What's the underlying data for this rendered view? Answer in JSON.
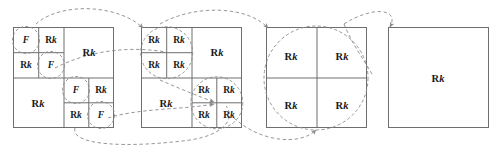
{
  "figure": {
    "background_color": "#ffffff",
    "line_color": "#6e6e6e",
    "dash_color": "#8a8a8a",
    "text_color": "#1a1a1a",
    "label_F": "F",
    "label_R": "R",
    "label_k": "k",
    "labels": {
      "fine_cell": "F",
      "coarse_cell": "Rk"
    },
    "squares": [
      {
        "name": "square-1",
        "x": 13,
        "y": 27,
        "size": 101,
        "description": "finest subdivision, mixed F and Rk cells",
        "cells": [
          {
            "name": "tl-1",
            "label": "F",
            "cx": 26,
            "cy": 40,
            "size": "sz-m",
            "circled": true
          },
          {
            "name": "tl-2",
            "label": "Rk",
            "cx": 51,
            "cy": 40,
            "size": "sz-m",
            "circled": false
          },
          {
            "name": "tl-3",
            "label": "Rk",
            "cx": 26,
            "cy": 65,
            "size": "sz-m",
            "circled": false
          },
          {
            "name": "tl-4",
            "label": "F",
            "cx": 51,
            "cy": 65,
            "size": "sz-m",
            "circled": true
          },
          {
            "name": "tr",
            "label": "Rk",
            "cx": 89,
            "cy": 52,
            "size": "sz-l",
            "circled": false
          },
          {
            "name": "bl",
            "label": "Rk",
            "cx": 38,
            "cy": 103,
            "size": "sz-l",
            "circled": false
          },
          {
            "name": "br-1",
            "label": "F",
            "cx": 76,
            "cy": 90,
            "size": "sz-m",
            "circled": true
          },
          {
            "name": "br-2",
            "label": "Rk",
            "cx": 101,
            "cy": 90,
            "size": "sz-m",
            "circled": false
          },
          {
            "name": "br-3",
            "label": "Rk",
            "cx": 76,
            "cy": 115,
            "size": "sz-m",
            "circled": false
          },
          {
            "name": "br-4",
            "label": "F",
            "cx": 101,
            "cy": 115,
            "size": "sz-m",
            "circled": true
          }
        ]
      },
      {
        "name": "square-2",
        "x": 141,
        "y": 27,
        "size": 101,
        "description": "second refinement, all Rk cells",
        "cells": [
          {
            "name": "tl-1",
            "label": "Rk",
            "cx": 154,
            "cy": 40,
            "size": "sz-m",
            "circled": false
          },
          {
            "name": "tl-2",
            "label": "Rk",
            "cx": 179,
            "cy": 40,
            "size": "sz-m",
            "circled": false
          },
          {
            "name": "tl-3",
            "label": "Rk",
            "cx": 154,
            "cy": 65,
            "size": "sz-m",
            "circled": false
          },
          {
            "name": "tl-4",
            "label": "Rk",
            "cx": 179,
            "cy": 65,
            "size": "sz-m",
            "circled": false
          },
          {
            "name": "tr",
            "label": "Rk",
            "cx": 217,
            "cy": 52,
            "size": "sz-l",
            "circled": false
          },
          {
            "name": "bl",
            "label": "Rk",
            "cx": 166,
            "cy": 103,
            "size": "sz-l",
            "circled": false
          },
          {
            "name": "br-1",
            "label": "Rk",
            "cx": 204,
            "cy": 90,
            "size": "sz-m",
            "circled": false
          },
          {
            "name": "br-2",
            "label": "Rk",
            "cx": 229,
            "cy": 90,
            "size": "sz-m",
            "circled": false
          },
          {
            "name": "br-3",
            "label": "Rk",
            "cx": 204,
            "cy": 115,
            "size": "sz-m",
            "circled": false
          },
          {
            "name": "br-4",
            "label": "Rk",
            "cx": 229,
            "cy": 115,
            "size": "sz-m",
            "circled": false
          }
        ]
      },
      {
        "name": "square-3",
        "x": 266,
        "y": 27,
        "size": 101,
        "description": "two-by-two grid of Rk cells",
        "cells": [
          {
            "name": "tl",
            "label": "Rk",
            "cx": 291,
            "cy": 56,
            "size": "sz-l",
            "circled": false
          },
          {
            "name": "tr",
            "label": "Rk",
            "cx": 342,
            "cy": 56,
            "size": "sz-l",
            "circled": false
          },
          {
            "name": "bl",
            "label": "Rk",
            "cx": 291,
            "cy": 105,
            "size": "sz-l",
            "circled": false
          },
          {
            "name": "br",
            "label": "Rk",
            "cx": 342,
            "cy": 105,
            "size": "sz-l",
            "circled": false
          }
        ]
      },
      {
        "name": "square-4",
        "x": 388,
        "y": 27,
        "size": 101,
        "description": "single undivided Rk cell",
        "cells": [
          {
            "name": "whole",
            "label": "Rk",
            "cx": 438,
            "cy": 78,
            "size": "sz-l",
            "circled": false
          }
        ]
      }
    ],
    "arrows": [
      {
        "name": "arrow-top-1-to-2",
        "from": "square-1-top-left-group",
        "to": "square-2-top-left-corner"
      },
      {
        "name": "arrow-top-2-to-3",
        "from": "square-2-top-left-group",
        "to": "square-3-top-left-corner"
      },
      {
        "name": "arrow-top-3-to-4",
        "from": "square-3-top-left",
        "to": "square-4-top-left-corner"
      },
      {
        "name": "arrow-mid-1-to-2",
        "from": "square-1-center-cell",
        "to": "square-2-center-cell"
      },
      {
        "name": "arrow-bottom-1-to-2",
        "from": "square-1-bottom-right-group",
        "to": "square-2-bottom-right-group"
      },
      {
        "name": "arrow-bottom-2-to-3",
        "from": "square-2-bottom-right-group",
        "to": "square-3-bottom-edge"
      }
    ]
  }
}
